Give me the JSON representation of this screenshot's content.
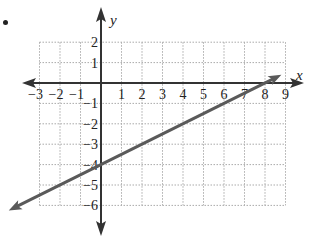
{
  "chart_data": {
    "type": "line",
    "title": "",
    "xlabel": "x",
    "ylabel": "y",
    "xlim": [
      -3,
      9
    ],
    "ylim": [
      -6,
      2
    ],
    "grid": true,
    "grid_style": "dotted",
    "x_ticks": [
      -3,
      -2,
      -1,
      1,
      2,
      3,
      4,
      5,
      6,
      7,
      8,
      9
    ],
    "y_ticks": [
      2,
      1,
      -1,
      -2,
      -3,
      -4,
      -5,
      -6
    ],
    "x_tick_labels": [
      "−3",
      "−2",
      "−1",
      "1",
      "2",
      "3",
      "4",
      "5",
      "6",
      "7",
      "8",
      "9"
    ],
    "y_tick_labels": [
      "2",
      "1",
      "−1",
      "−2",
      "−3",
      "−4",
      "−5",
      "−6"
    ],
    "series": [
      {
        "name": "line",
        "equation": "y = 0.5x - 4",
        "slope": 0.5,
        "y_intercept": -4,
        "x_intercept": 8,
        "points": [
          [
            -4.5,
            -6.25
          ],
          [
            0,
            -4
          ],
          [
            8,
            0
          ],
          [
            8.8,
            0.4
          ]
        ],
        "color": "#5a5a5a",
        "arrows": "both"
      }
    ],
    "axis_color": "#333333",
    "grid_color": "#aaaaaa"
  },
  "labels": {
    "x_axis": "x",
    "y_axis": "y"
  }
}
